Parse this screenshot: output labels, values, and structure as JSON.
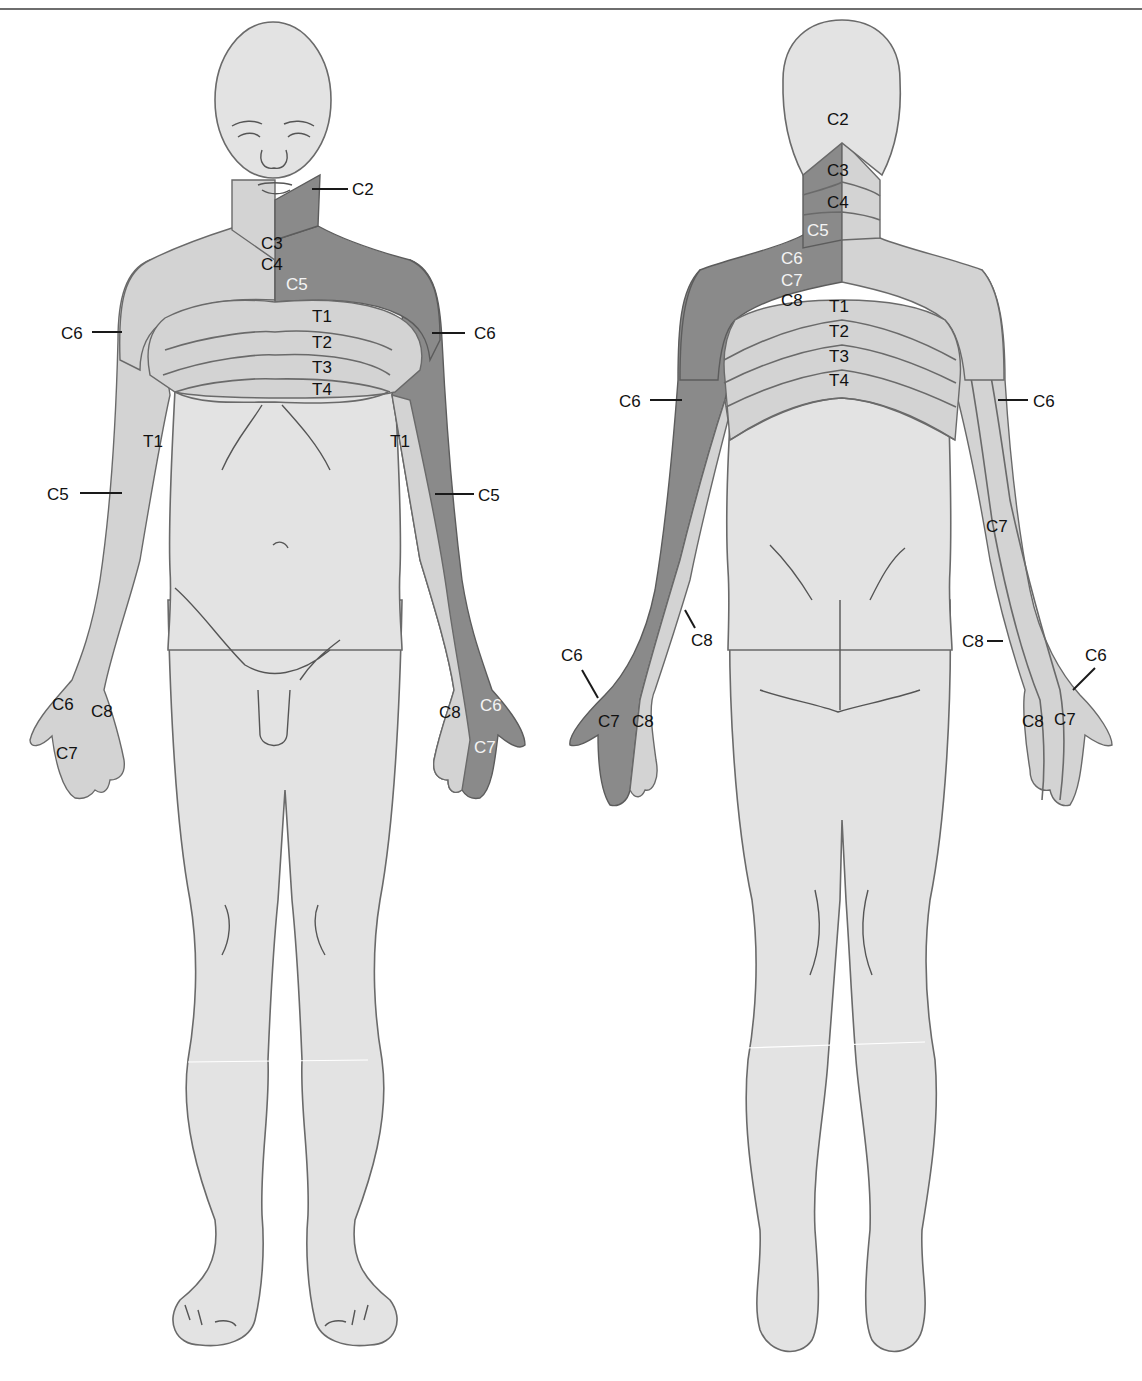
{
  "figure": {
    "type": "dermatome-map",
    "views": [
      "anterior",
      "posterior"
    ],
    "colors": {
      "background": "#ffffff",
      "skin": "#e3e3e3",
      "dermatome_light": "#d3d3d3",
      "dermatome_dark": "#8a8a8a",
      "outline": "#6a6a6a",
      "label_dark": "#111111",
      "label_light": "#f4f4f4"
    }
  },
  "anterior": {
    "labels": {
      "c2": "C2",
      "c3": "C3",
      "c4": "C4",
      "c5_shoulder": "C5",
      "c6_left": "C6",
      "c6_right": "C6",
      "t1_chest": "T1",
      "t2": "T2",
      "t3": "T3",
      "t4": "T4",
      "t1_arm_left": "T1",
      "t1_arm_right": "T1",
      "c5_arm_left": "C5",
      "c5_arm_right": "C5",
      "hand_left_c6": "C6",
      "hand_left_c8": "C8",
      "hand_left_c7": "C7",
      "hand_right_c8": "C8",
      "hand_right_c6": "C6",
      "hand_right_c7": "C7"
    }
  },
  "posterior": {
    "labels": {
      "c2": "C2",
      "c3": "C3",
      "c4": "C4",
      "c5": "C5",
      "c6": "C6",
      "c7": "C7",
      "c8": "C8",
      "t1": "T1",
      "t2": "T2",
      "t3": "T3",
      "t4": "T4",
      "c6_arm_left": "C6",
      "c6_arm_right": "C6",
      "c7_arm_right": "C7",
      "c8_forearm_left": "C8",
      "c8_forearm_right": "C8",
      "hand_left_c6": "C6",
      "hand_left_c7": "C7",
      "hand_left_c8": "C8",
      "hand_right_c6": "C6",
      "hand_right_c8": "C8",
      "hand_right_c7": "C7"
    }
  }
}
